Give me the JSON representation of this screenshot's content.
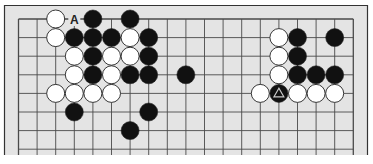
{
  "diagram": {
    "type": "go-board-fragment",
    "colors": {
      "board_bg": "#e4e4e4",
      "grid_line": "#4a4a4a",
      "frame_line": "#333333",
      "black_stone": "#111111",
      "white_stone": "#ffffff",
      "stone_outline": "#222222",
      "marker": "#cccccc"
    },
    "grid": {
      "columns": 19,
      "rows_visible": 8,
      "origin_x": 18.5,
      "origin_y": 19,
      "spacing": 18.6,
      "top_edge": true,
      "left_edge": true,
      "right_edge": true,
      "bottom_edge": false
    },
    "stones": [
      {
        "color": "white",
        "col": 2,
        "row": 0
      },
      {
        "color": "black",
        "col": 4,
        "row": 0
      },
      {
        "color": "black",
        "col": 6,
        "row": 0
      },
      {
        "color": "white",
        "col": 2,
        "row": 1
      },
      {
        "color": "black",
        "col": 3,
        "row": 1
      },
      {
        "color": "black",
        "col": 4,
        "row": 1
      },
      {
        "color": "black",
        "col": 5,
        "row": 1
      },
      {
        "color": "white",
        "col": 6,
        "row": 1
      },
      {
        "color": "black",
        "col": 7,
        "row": 1
      },
      {
        "color": "white",
        "col": 3,
        "row": 2
      },
      {
        "color": "black",
        "col": 4,
        "row": 2
      },
      {
        "color": "white",
        "col": 5,
        "row": 2
      },
      {
        "color": "white",
        "col": 6,
        "row": 2
      },
      {
        "color": "black",
        "col": 7,
        "row": 2
      },
      {
        "color": "white",
        "col": 3,
        "row": 3
      },
      {
        "color": "black",
        "col": 4,
        "row": 3
      },
      {
        "color": "white",
        "col": 5,
        "row": 3
      },
      {
        "color": "black",
        "col": 6,
        "row": 3
      },
      {
        "color": "black",
        "col": 7,
        "row": 3
      },
      {
        "color": "black",
        "col": 9,
        "row": 3
      },
      {
        "color": "white",
        "col": 2,
        "row": 4
      },
      {
        "color": "white",
        "col": 3,
        "row": 4
      },
      {
        "color": "white",
        "col": 4,
        "row": 4
      },
      {
        "color": "white",
        "col": 5,
        "row": 4
      },
      {
        "color": "black",
        "col": 3,
        "row": 5
      },
      {
        "color": "black",
        "col": 7,
        "row": 5
      },
      {
        "color": "black",
        "col": 6,
        "row": 6
      },
      {
        "color": "white",
        "col": 14,
        "row": 1
      },
      {
        "color": "black",
        "col": 15,
        "row": 1
      },
      {
        "color": "black",
        "col": 17,
        "row": 1
      },
      {
        "color": "white",
        "col": 14,
        "row": 2
      },
      {
        "color": "black",
        "col": 15,
        "row": 2
      },
      {
        "color": "white",
        "col": 14,
        "row": 3
      },
      {
        "color": "black",
        "col": 15,
        "row": 3
      },
      {
        "color": "black",
        "col": 16,
        "row": 3
      },
      {
        "color": "black",
        "col": 17,
        "row": 3
      },
      {
        "color": "white",
        "col": 13,
        "row": 4
      },
      {
        "color": "black",
        "col": 14,
        "row": 4,
        "marker": "triangle"
      },
      {
        "color": "white",
        "col": 15,
        "row": 4
      },
      {
        "color": "white",
        "col": 16,
        "row": 4
      },
      {
        "color": "white",
        "col": 17,
        "row": 4
      }
    ],
    "labels": [
      {
        "text": "A",
        "col": 3,
        "row": 0
      }
    ]
  }
}
